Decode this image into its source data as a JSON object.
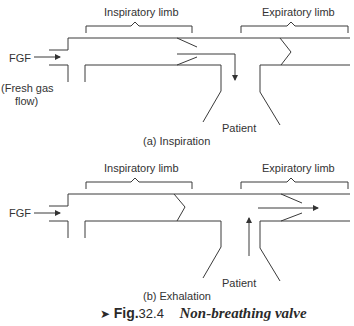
{
  "figure": {
    "caption_marker": "➤",
    "caption_label": "Fig.",
    "caption_number": "32.4",
    "caption_title": "Non-breathing valve"
  },
  "panels": [
    {
      "id": "a",
      "subtitle": "(a) Inspiration",
      "inspiratory_label": "Inspiratory limb",
      "expiratory_label": "Expiratory limb",
      "fgf_label": "FGF",
      "fgf_note_line1": "(Fresh gas",
      "fgf_note_line2": "flow)",
      "patient_label": "Patient",
      "flow_direction": "fresh gas to patient (down arrow)"
    },
    {
      "id": "b",
      "subtitle": "(b) Exhalation",
      "inspiratory_label": "Inspiratory limb",
      "expiratory_label": "Expiratory limb",
      "fgf_label": "FGF",
      "patient_label": "Patient",
      "flow_direction": "patient to expiratory limb (up then right arrow)"
    }
  ],
  "colors": {
    "line": "#3a3a3a",
    "text": "#333333",
    "background": "#ffffff"
  }
}
